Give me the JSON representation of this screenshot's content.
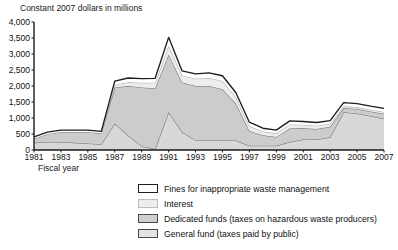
{
  "chart_data": {
    "type": "area",
    "stacked": true,
    "title": "Constant 2007 dollars in millions",
    "xlabel": "Fiscal year",
    "ylabel": "Constant 2007 dollars in millions",
    "grid": false,
    "legend_position": "bottom",
    "xlim": [
      1981,
      2007
    ],
    "ylim": [
      0,
      4000
    ],
    "ytick_labels": [
      "4,000",
      "3,500",
      "3,000",
      "2,500",
      "2,000",
      "1,500",
      "1,000",
      "500",
      "0"
    ],
    "ytick_values": [
      4000,
      3500,
      3000,
      2500,
      2000,
      1500,
      1000,
      500,
      0
    ],
    "xtick_labels": [
      "1981",
      "1983",
      "1985",
      "1987",
      "1989",
      "1991",
      "1993",
      "1995",
      "1997",
      "1999",
      "2001",
      "2003",
      "2005",
      "2007"
    ],
    "xtick_values": [
      1981,
      1983,
      1985,
      1987,
      1989,
      1991,
      1993,
      1995,
      1997,
      1999,
      2001,
      2003,
      2005,
      2007
    ],
    "x": [
      1981,
      1982,
      1983,
      1984,
      1985,
      1986,
      1987,
      1988,
      1989,
      1990,
      1991,
      1992,
      1993,
      1994,
      1995,
      1996,
      1997,
      1998,
      1999,
      2000,
      2001,
      2002,
      2003,
      2004,
      2005,
      2006,
      2007
    ],
    "series": [
      {
        "name": "General fund (taxes paid by public)",
        "color": "#d8d8d8",
        "line_color": "#6e6e6e",
        "order": 1,
        "values": [
          230,
          250,
          250,
          230,
          200,
          180,
          830,
          450,
          120,
          30,
          1180,
          560,
          300,
          300,
          300,
          300,
          130,
          130,
          130,
          250,
          330,
          330,
          400,
          1180,
          1140,
          1060,
          980
        ]
      },
      {
        "name": "Dedicated funds (taxes on hazardous waste producers)",
        "color": "#cccccc",
        "line_color": "#6e6e6e",
        "order": 2,
        "values": [
          120,
          250,
          310,
          330,
          360,
          340,
          1120,
          1550,
          1830,
          1900,
          1800,
          1550,
          1700,
          1700,
          1600,
          1150,
          460,
          330,
          280,
          420,
          350,
          330,
          330,
          130,
          140,
          140,
          150
        ]
      },
      {
        "name": "Interest",
        "color": "#ededed",
        "line_color": "#a8a8a8",
        "order": 3,
        "values": [
          0,
          0,
          0,
          0,
          0,
          0,
          80,
          120,
          150,
          170,
          280,
          220,
          230,
          250,
          260,
          200,
          160,
          120,
          110,
          130,
          110,
          100,
          90,
          60,
          60,
          60,
          60
        ]
      },
      {
        "name": "Fines for inappropriate waste management",
        "color": "#ffffff",
        "line_color": "#1d1d1d",
        "order": 4,
        "values": [
          60,
          60,
          60,
          60,
          60,
          60,
          120,
          130,
          130,
          140,
          260,
          140,
          150,
          160,
          160,
          140,
          120,
          100,
          100,
          110,
          100,
          100,
          100,
          110,
          110,
          110,
          110
        ]
      }
    ],
    "legend": [
      {
        "label": "Fines for inappropriate waste management",
        "swatch": "white-dark-border"
      },
      {
        "label": "Interest",
        "swatch": "very-light-gray"
      },
      {
        "label": "Dedicated funds (taxes on hazardous waste producers)",
        "swatch": "medium-gray"
      },
      {
        "label": "General fund (taxes paid by public)",
        "swatch": "light-gray"
      }
    ],
    "stack_totals": [
      410,
      560,
      620,
      620,
      620,
      580,
      2150,
      2250,
      2230,
      2240,
      3520,
      2470,
      2380,
      2410,
      2320,
      1790,
      870,
      680,
      620,
      910,
      890,
      860,
      920,
      1480,
      1450,
      1370,
      1300
    ],
    "colors": {
      "axis": "#1a1a1a",
      "text": "#111111",
      "background": "#ffffff"
    }
  }
}
